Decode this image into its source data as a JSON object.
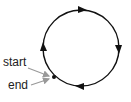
{
  "diagram": {
    "type": "closed-loop-cycle",
    "direction": "clockwise",
    "labels": {
      "start": "start",
      "end": "end"
    },
    "arrows": [
      {
        "position": "top",
        "points": "right"
      },
      {
        "position": "right",
        "points": "down"
      },
      {
        "position": "bottom",
        "points": "left"
      },
      {
        "position": "left",
        "points": "up"
      }
    ],
    "colors": {
      "loop": "#111111",
      "pointer": "#999999",
      "text": "#222222"
    }
  }
}
